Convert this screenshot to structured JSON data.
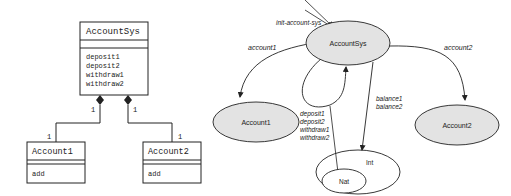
{
  "uml": {
    "root": {
      "name": "AccountSys",
      "methods": [
        "deposit1",
        "deposit2",
        "withdraw1",
        "withdraw2"
      ]
    },
    "children": [
      {
        "name": "Account1",
        "methods": [
          "add"
        ],
        "mult_parent": "1",
        "mult_child": "1"
      },
      {
        "name": "Account2",
        "methods": [
          "add"
        ],
        "mult_parent": "1",
        "mult_child": "1"
      }
    ]
  },
  "graph": {
    "init_label": "init-account-sys",
    "nodes": {
      "root": "AccountSys",
      "account1": "Account1",
      "account2": "Account2",
      "int": "Int",
      "nat": "Nat"
    },
    "edges": {
      "account1": "account1",
      "account2": "account2",
      "ops": [
        "deposit1",
        "deposit2",
        "withdraw1",
        "withdraw2"
      ],
      "balances": [
        "balance1",
        "balance2"
      ]
    }
  },
  "colors": {
    "stroke": "#222222",
    "node_fill": "#e3e3e3",
    "background": "#ffffff"
  }
}
